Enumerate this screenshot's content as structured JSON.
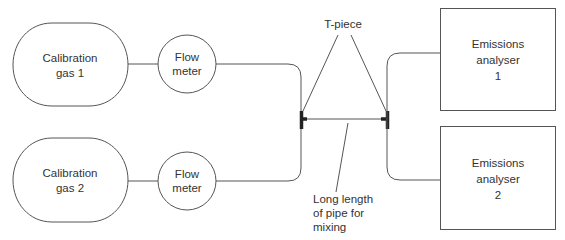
{
  "diagram": {
    "type": "flow-schematic",
    "nodes": {
      "gas1": {
        "lines": [
          "Calibration",
          "gas 1"
        ]
      },
      "gas2": {
        "lines": [
          "Calibration",
          "gas 2"
        ]
      },
      "flow1": {
        "lines": [
          "Flow",
          "meter"
        ]
      },
      "flow2": {
        "lines": [
          "Flow",
          "meter"
        ]
      },
      "analyser1": {
        "lines": [
          "Emissions",
          "analyser",
          "1"
        ]
      },
      "analyser2": {
        "lines": [
          "Emissions",
          "analyser",
          "2"
        ]
      }
    },
    "labels": {
      "tpiece": "T-piece",
      "mixing": [
        "Long length",
        "of pipe for",
        "mixing"
      ]
    },
    "edges": [
      {
        "from": "gas1",
        "to": "flow1"
      },
      {
        "from": "gas2",
        "to": "flow2"
      },
      {
        "from": "flow1",
        "to": "left-t-piece"
      },
      {
        "from": "flow2",
        "to": "left-t-piece"
      },
      {
        "from": "left-t-piece",
        "to": "right-t-piece",
        "label": "Long length of pipe for mixing"
      },
      {
        "from": "right-t-piece",
        "to": "analyser1"
      },
      {
        "from": "right-t-piece",
        "to": "analyser2"
      }
    ],
    "colors": {
      "line": "#555555",
      "tee": "#222222",
      "text": "#333333",
      "background": "#ffffff"
    }
  }
}
